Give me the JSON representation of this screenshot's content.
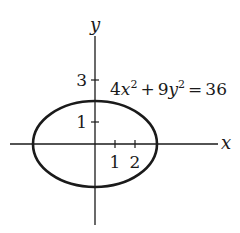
{
  "figure": {
    "type": "ellipse-graph",
    "equation": {
      "text": "4x² + 9y² = 36",
      "parts": {
        "coef_x": "4",
        "var_x": "x",
        "exp_x": "2",
        "plus": "+",
        "coef_y": "9",
        "var_y": "y",
        "exp_y": "2",
        "eq": "=",
        "rhs": "36"
      }
    },
    "axes": {
      "x_label": "x",
      "y_label": "y",
      "x_ticks": [
        {
          "value": 1,
          "label": "1"
        },
        {
          "value": 2,
          "label": "2"
        }
      ],
      "y_ticks": [
        {
          "value": 1,
          "label": "1"
        },
        {
          "value": 3,
          "label": "3"
        }
      ]
    },
    "ellipse": {
      "center": [
        0,
        0
      ],
      "semi_major_x": 3,
      "semi_minor_y": 2
    },
    "colors": {
      "stroke": "#1a1a1a",
      "background": "#ffffff"
    }
  }
}
